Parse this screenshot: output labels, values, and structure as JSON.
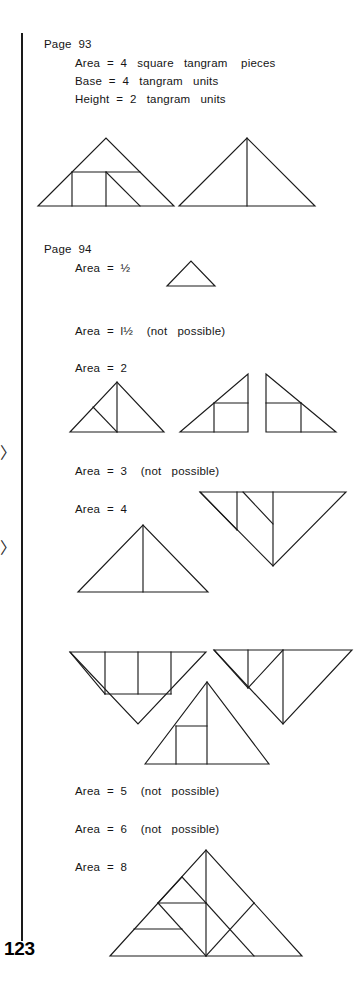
{
  "page": {
    "page_number": "123",
    "width": 358,
    "height": 996,
    "background_color": "#ffffff",
    "ink_color": "#1b1b1b"
  },
  "edge_marks": [
    {
      "name": "edge-arrow-upper",
      "glyph": "〉",
      "top": 445
    },
    {
      "name": "edge-arrow-lower",
      "glyph": "〉",
      "top": 540
    }
  ],
  "sections": [
    {
      "id": "page-93",
      "heading": "Page  93",
      "lines": [
        "Area  =  4   square   tangram    pieces",
        "Base  =  4   tangram   units",
        "Height  =  2   tangram   units"
      ]
    },
    {
      "id": "page-94",
      "heading": "Page  94",
      "lines": [
        "Area  =  ½",
        "Area  =  l½    (not   possible)",
        "Area  =  2",
        "Area  =  3    (not   possible)",
        "Area  =  4",
        "Area  =  5    (not   possible)",
        "Area  =  6    (not   possible)",
        "Area  =  8"
      ]
    }
  ],
  "labels": {
    "page93_heading": "Page  93",
    "page93_area": "Area  =  4   square   tangram    pieces",
    "page93_base": "Base  =  4   tangram   units",
    "page93_height": "Height  =  2   tangram   units",
    "page94_heading": "Page  94",
    "area_half": "Area  =  ½",
    "area_one_half": "Area  =  l½    (not   possible)",
    "area_2": "Area  =  2",
    "area_3": "Area  =  3    (not   possible)",
    "area_4": "Area  =  4",
    "area_5": "Area  =  5    (not   possible)",
    "area_6": "Area  =  6    (not   possible)",
    "area_8": "Area  =  8",
    "page_number": "123"
  },
  "figures": [
    {
      "name": "figure-p93-subdivided-triangle",
      "caption_group": "page93",
      "description": "Large triangle, base 4 units, height 2 units, subdivided into square and tangram pieces"
    },
    {
      "name": "figure-p93-plain-triangle",
      "caption_group": "page93",
      "description": "Large triangle with single vertical median line"
    },
    {
      "name": "figure-area-half",
      "caption_group": "area_half",
      "description": "Single small tangram triangle"
    },
    {
      "name": "figure-area-2-a",
      "caption_group": "area_2",
      "description": "Triangle with vertical median and one internal diagonal"
    },
    {
      "name": "figure-area-2-b",
      "caption_group": "area_2",
      "description": "Right triangle with vertical line and parallel diagonal"
    },
    {
      "name": "figure-area-2-c",
      "caption_group": "area_2",
      "description": "Right triangle containing a square"
    },
    {
      "name": "figure-area-4-a",
      "caption_group": "area_4",
      "description": "Large triangle with vertical median"
    },
    {
      "name": "figure-area-4-b",
      "caption_group": "area_4",
      "description": "Inverted triangle subdivided with verticals and diagonals"
    },
    {
      "name": "figure-area-4-c",
      "caption_group": "area_4",
      "description": "Inverted triangle with square piece and internal diagonals"
    },
    {
      "name": "figure-area-4-d",
      "caption_group": "area_4",
      "description": "Inverted triangle with verticals and internal diagonals"
    },
    {
      "name": "figure-area-4-e",
      "caption_group": "area_4",
      "description": "Upright triangle containing a square near the base"
    },
    {
      "name": "figure-area-8",
      "caption_group": "area_8",
      "description": "Wide triangle fully dissected into the seven tangram pieces"
    }
  ]
}
